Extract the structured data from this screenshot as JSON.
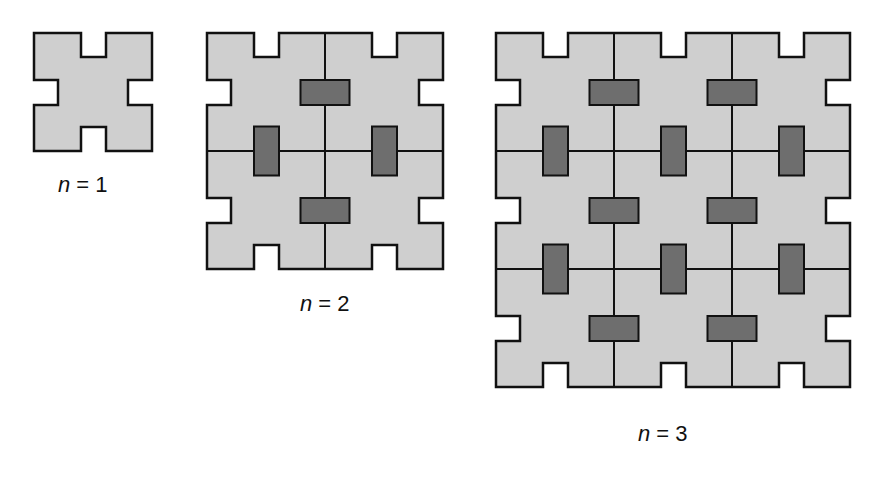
{
  "colors": {
    "tile_fill": "#cfcfcf",
    "block_fill": "#6e6e6e",
    "stroke": "#111111",
    "background": "#ffffff"
  },
  "geometry": {
    "cell": 118,
    "notch_offset": 47,
    "notch_width": 25,
    "notch_depth": 24,
    "block_long": 49,
    "block_short": 25
  },
  "figures": [
    {
      "id": "n1",
      "n": 1,
      "origin": [
        34,
        33
      ],
      "label_var": "n",
      "label_rest": " = 1",
      "label_pos": [
        58,
        172
      ]
    },
    {
      "id": "n2",
      "n": 2,
      "origin": [
        207,
        33
      ],
      "label_var": "n",
      "label_rest": " = 2",
      "label_pos": [
        300,
        291
      ]
    },
    {
      "id": "n3",
      "n": 3,
      "origin": [
        496,
        33
      ],
      "label_var": "n",
      "label_rest": " = 3",
      "label_pos": [
        638,
        421
      ]
    }
  ]
}
